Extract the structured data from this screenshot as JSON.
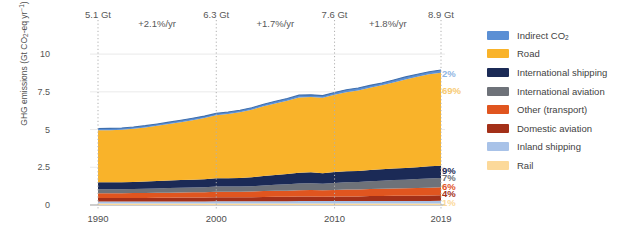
{
  "chart_data": {
    "type": "area",
    "title": "",
    "subtitle": "",
    "xlabel": "",
    "ylabel": "GHG emissions (Gt CO2-eq yr-1)",
    "ylabel_parts": {
      "pre": "GHG emissions (Gt CO",
      "sub": "2",
      "mid": "-eq yr",
      "sup": "−1",
      "post": ")"
    },
    "x": [
      1990,
      1991,
      1992,
      1993,
      1994,
      1995,
      1996,
      1997,
      1998,
      1999,
      2000,
      2001,
      2002,
      2003,
      2004,
      2005,
      2006,
      2007,
      2008,
      2009,
      2010,
      2011,
      2012,
      2013,
      2014,
      2015,
      2016,
      2017,
      2018,
      2019
    ],
    "xlim": [
      1990,
      2019
    ],
    "ylim": [
      0,
      11.2
    ],
    "yticks": [
      "0",
      "2.5",
      "5",
      "7.5",
      "10"
    ],
    "ytick_values": [
      0,
      2.5,
      5,
      7.5,
      10
    ],
    "xticks": [
      "1990",
      "2000",
      "2010",
      "2019"
    ],
    "xtick_values": [
      1990,
      2000,
      2010,
      2019
    ],
    "grid": "horizontal-light, vertical-dotted-at-markers",
    "legend_position": "right",
    "stack_order_bottom_to_top": [
      "Rail",
      "Inland shipping",
      "Domestic aviation",
      "Other (transport)",
      "International aviation",
      "International shipping",
      "Road",
      "Indirect CO2"
    ],
    "series": [
      {
        "name": "Rail",
        "color": "#fcd99a",
        "share_2019": "1%",
        "values": [
          0.1,
          0.1,
          0.1,
          0.1,
          0.1,
          0.1,
          0.1,
          0.1,
          0.1,
          0.1,
          0.1,
          0.1,
          0.1,
          0.1,
          0.1,
          0.1,
          0.1,
          0.1,
          0.1,
          0.1,
          0.1,
          0.1,
          0.1,
          0.1,
          0.1,
          0.1,
          0.1,
          0.1,
          0.1,
          0.1
        ]
      },
      {
        "name": "Inland shipping",
        "color": "#a8c2e8",
        "share_2019": "2%",
        "values": [
          0.14,
          0.14,
          0.14,
          0.14,
          0.14,
          0.14,
          0.14,
          0.14,
          0.14,
          0.14,
          0.15,
          0.15,
          0.15,
          0.15,
          0.15,
          0.15,
          0.15,
          0.16,
          0.16,
          0.16,
          0.16,
          0.16,
          0.16,
          0.17,
          0.17,
          0.17,
          0.17,
          0.17,
          0.17,
          0.18
        ]
      },
      {
        "name": "Domestic aviation",
        "color": "#a33018",
        "share_2019": "4%",
        "values": [
          0.22,
          0.22,
          0.22,
          0.23,
          0.23,
          0.24,
          0.24,
          0.25,
          0.25,
          0.26,
          0.27,
          0.26,
          0.26,
          0.27,
          0.28,
          0.29,
          0.29,
          0.3,
          0.3,
          0.29,
          0.3,
          0.31,
          0.31,
          0.32,
          0.33,
          0.34,
          0.34,
          0.35,
          0.36,
          0.36
        ]
      },
      {
        "name": "Other (transport)",
        "color": "#e0551f",
        "share_2019": "6%",
        "values": [
          0.32,
          0.32,
          0.32,
          0.32,
          0.33,
          0.33,
          0.34,
          0.34,
          0.35,
          0.35,
          0.36,
          0.37,
          0.37,
          0.38,
          0.39,
          0.4,
          0.41,
          0.42,
          0.43,
          0.43,
          0.44,
          0.45,
          0.46,
          0.47,
          0.48,
          0.49,
          0.5,
          0.51,
          0.52,
          0.53
        ]
      },
      {
        "name": "International aviation",
        "color": "#6e7279",
        "share_2019": "7%",
        "values": [
          0.26,
          0.26,
          0.26,
          0.27,
          0.28,
          0.29,
          0.3,
          0.31,
          0.32,
          0.33,
          0.35,
          0.34,
          0.34,
          0.35,
          0.38,
          0.4,
          0.42,
          0.44,
          0.45,
          0.43,
          0.46,
          0.48,
          0.49,
          0.51,
          0.53,
          0.55,
          0.57,
          0.59,
          0.61,
          0.62
        ]
      },
      {
        "name": "International shipping",
        "color": "#1b2a56",
        "share_2019": "9%",
        "values": [
          0.46,
          0.46,
          0.46,
          0.47,
          0.48,
          0.49,
          0.5,
          0.51,
          0.52,
          0.53,
          0.55,
          0.56,
          0.57,
          0.59,
          0.62,
          0.65,
          0.68,
          0.71,
          0.73,
          0.7,
          0.72,
          0.74,
          0.74,
          0.75,
          0.76,
          0.77,
          0.78,
          0.79,
          0.8,
          0.81
        ]
      },
      {
        "name": "Road",
        "color": "#f9b32a",
        "share_2019": "69%",
        "values": [
          3.45,
          3.46,
          3.48,
          3.52,
          3.58,
          3.66,
          3.75,
          3.84,
          3.94,
          4.05,
          4.16,
          4.25,
          4.36,
          4.47,
          4.62,
          4.74,
          4.86,
          5.0,
          4.98,
          4.99,
          5.13,
          5.24,
          5.33,
          5.45,
          5.56,
          5.7,
          5.86,
          5.99,
          6.1,
          6.17
        ]
      },
      {
        "name": "Indirect CO2",
        "color": "#5b8fd4",
        "share_2019": "2%",
        "values": [
          0.12,
          0.12,
          0.12,
          0.12,
          0.12,
          0.12,
          0.12,
          0.13,
          0.13,
          0.13,
          0.13,
          0.13,
          0.13,
          0.14,
          0.14,
          0.14,
          0.15,
          0.15,
          0.15,
          0.15,
          0.15,
          0.16,
          0.16,
          0.16,
          0.16,
          0.17,
          0.17,
          0.17,
          0.17,
          0.18
        ]
      }
    ],
    "annotations": {
      "gt_markers": [
        {
          "year": 1990,
          "label": "5.1 Gt"
        },
        {
          "year": 2000,
          "label": "6.3 Gt"
        },
        {
          "year": 2010,
          "label": "7.6 Gt"
        },
        {
          "year": 2019,
          "label": "8.9 Gt"
        }
      ],
      "growth_rates": [
        {
          "from": 1990,
          "to": 2000,
          "label": "+2.1%/yr"
        },
        {
          "from": 2000,
          "to": 2010,
          "label": "+1.7%/yr"
        },
        {
          "from": 2010,
          "to": 2019,
          "label": "+1.8%/yr"
        }
      ],
      "share_labels": [
        {
          "label": "2%",
          "series": "Indirect CO2",
          "color": "#8fb4e2",
          "value": 8.72
        },
        {
          "label": "69%",
          "series": "Road",
          "color": "#f7ca72",
          "value": 7.6
        },
        {
          "label": "9%",
          "series": "International shipping",
          "color": "#1b2a56",
          "value": 2.32
        },
        {
          "label": "7%",
          "series": "International aviation",
          "color": "#6e7279",
          "value": 1.83
        },
        {
          "label": "6%",
          "series": "Other (transport)",
          "color": "#e0551f",
          "value": 1.28
        },
        {
          "label": "4%",
          "series": "Domestic aviation",
          "color": "#a33018",
          "value": 0.82
        },
        {
          "label": "1%",
          "series": "Rail",
          "color": "#fcd99a",
          "value": 0.2
        }
      ]
    }
  },
  "legend": {
    "items": [
      {
        "label": "Indirect CO2",
        "label_pre": "Indirect CO",
        "label_sub": "2",
        "color": "#5b8fd4"
      },
      {
        "label": "Road",
        "label_pre": "Road",
        "label_sub": "",
        "color": "#f9b32a"
      },
      {
        "label": "International shipping",
        "label_pre": "International shipping",
        "label_sub": "",
        "color": "#1b2a56"
      },
      {
        "label": "International aviation",
        "label_pre": "International aviation",
        "label_sub": "",
        "color": "#6e7279"
      },
      {
        "label": "Other (transport)",
        "label_pre": "Other (transport)",
        "label_sub": "",
        "color": "#e0551f"
      },
      {
        "label": "Domestic aviation",
        "label_pre": "Domestic aviation",
        "label_sub": "",
        "color": "#a33018"
      },
      {
        "label": "Inland shipping",
        "label_pre": "Inland shipping",
        "label_sub": "",
        "color": "#a8c2e8"
      },
      {
        "label": "Rail",
        "label_pre": "Rail",
        "label_sub": "",
        "color": "#fcd99a"
      }
    ]
  }
}
